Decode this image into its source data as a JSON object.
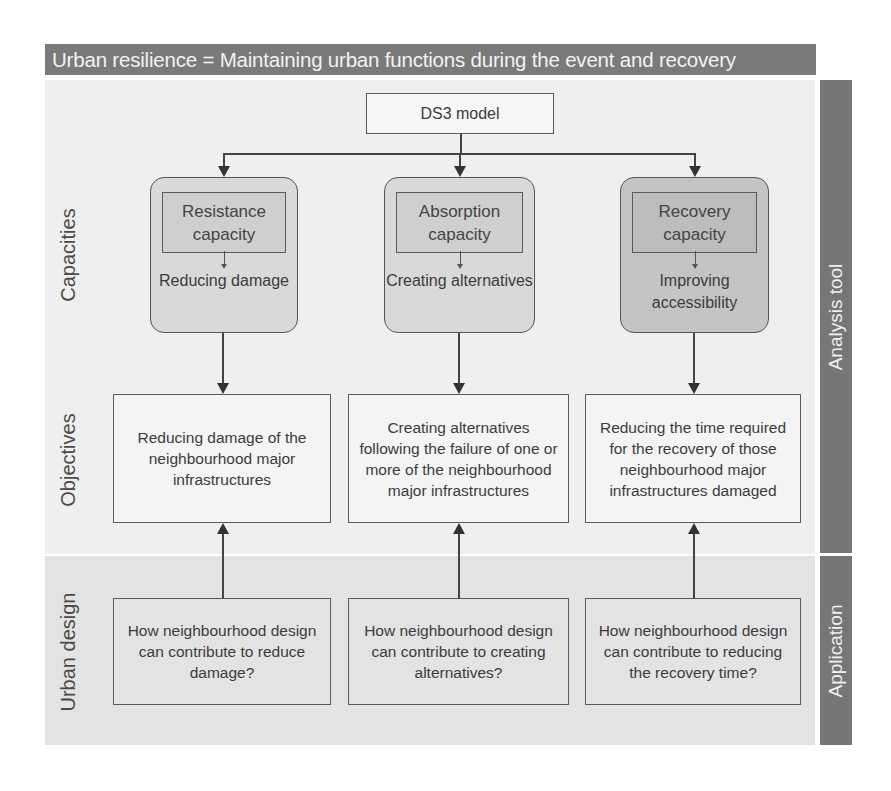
{
  "header": {
    "title": "Urban resilience = Maintaining urban functions during the event and recovery"
  },
  "model": {
    "label": "DS3 model"
  },
  "row_labels": {
    "capacities": "Capacities",
    "objectives": "Objectives",
    "urban_design": "Urban design"
  },
  "side_labels": {
    "analysis": "Analysis tool",
    "application": "Application"
  },
  "capacities": [
    {
      "title": "Resistance capacity",
      "outcome": "Reducing damage"
    },
    {
      "title": "Absorption capacity",
      "outcome": "Creating alternatives"
    },
    {
      "title": "Recovery capacity",
      "outcome": "Improving accessibility"
    }
  ],
  "objectives": [
    {
      "text": "Reducing damage of the neighbourhood major infrastructures"
    },
    {
      "text": "Creating alternatives following the failure of one or more of the neighbourhood major infrastructures"
    },
    {
      "text": "Reducing the time required for the recovery of those neighbourhood major infrastructures damaged"
    }
  ],
  "urban_design": [
    {
      "text": "How neighbourhood design can contribute to reduce damage?"
    },
    {
      "text": "How neighbourhood design can contribute to creating alternatives?"
    },
    {
      "text": "How neighbourhood design can contribute to reducing the recovery time?"
    }
  ],
  "colors": {
    "header_bg": "#7a7a7a",
    "sidebar_bg": "#767676",
    "panel_top_bg": "#efefef",
    "panel_bottom_bg": "#e3e3e3",
    "capacity_fill": "#d9d9d9",
    "recovery_fill": "#c4c4c4"
  }
}
